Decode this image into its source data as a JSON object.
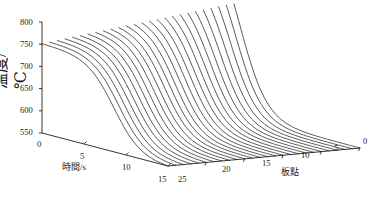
{
  "chart_data": {
    "type": "line",
    "title": "",
    "subtitle": "",
    "projection": "3d-waterfall",
    "grid": false,
    "legend": false,
    "legend_position": "none",
    "axes": {
      "vertical": {
        "label": "溫度/℃",
        "ticks": [
          550,
          600,
          650,
          700,
          750,
          800
        ],
        "tick_labels": [
          "550",
          "600",
          "650",
          "700",
          "750",
          "800"
        ],
        "range": [
          550,
          800
        ],
        "step": 50
      },
      "depth_left": {
        "label": "時間/s",
        "ticks": [
          0,
          5,
          10,
          15
        ],
        "tick_labels": [
          "0",
          "5",
          "10",
          "15"
        ],
        "range": [
          0,
          15
        ],
        "step": 5
      },
      "depth_right": {
        "label": "板點",
        "ticks": [
          25,
          20,
          15,
          10,
          5,
          0
        ],
        "tick_labels": [
          "25",
          "20",
          "15",
          "10",
          "5",
          "0"
        ],
        "range": [
          0,
          25
        ],
        "step": 5,
        "direction": "decreasing"
      }
    },
    "series_count": 26,
    "series_note": "One temperature-decay curve per plate point (板點 0–25); each curve falls from roughly 800℃ to 550℃ over 0–15 s.",
    "series": [
      {
        "name": "0",
        "start": 800,
        "end": 550
      },
      {
        "name": "1",
        "start": 799,
        "end": 550
      },
      {
        "name": "2",
        "start": 797,
        "end": 550
      },
      {
        "name": "3",
        "start": 795,
        "end": 550
      },
      {
        "name": "4",
        "start": 793,
        "end": 550
      },
      {
        "name": "5",
        "start": 791,
        "end": 550
      },
      {
        "name": "6",
        "start": 789,
        "end": 550
      },
      {
        "name": "7",
        "start": 787,
        "end": 550
      },
      {
        "name": "8",
        "start": 785,
        "end": 550
      },
      {
        "name": "9",
        "start": 783,
        "end": 550
      },
      {
        "name": "10",
        "start": 781,
        "end": 550
      },
      {
        "name": "11",
        "start": 779,
        "end": 550
      },
      {
        "name": "12",
        "start": 777,
        "end": 550
      },
      {
        "name": "13",
        "start": 775,
        "end": 550
      },
      {
        "name": "14",
        "start": 773,
        "end": 550
      },
      {
        "name": "15",
        "start": 771,
        "end": 550
      },
      {
        "name": "16",
        "start": 769,
        "end": 550
      },
      {
        "name": "17",
        "start": 767,
        "end": 550
      },
      {
        "name": "18",
        "start": 765,
        "end": 550
      },
      {
        "name": "19",
        "start": 763,
        "end": 550
      },
      {
        "name": "20",
        "start": 761,
        "end": 550
      },
      {
        "name": "21",
        "start": 759,
        "end": 550
      },
      {
        "name": "22",
        "start": 757,
        "end": 550
      },
      {
        "name": "23",
        "start": 755,
        "end": 550
      },
      {
        "name": "24",
        "start": 753,
        "end": 550
      },
      {
        "name": "25",
        "start": 751,
        "end": 550
      }
    ],
    "colors": {
      "line": "#2b2b2b",
      "axis": "#1d1d1d",
      "background": "#ffffff"
    }
  }
}
